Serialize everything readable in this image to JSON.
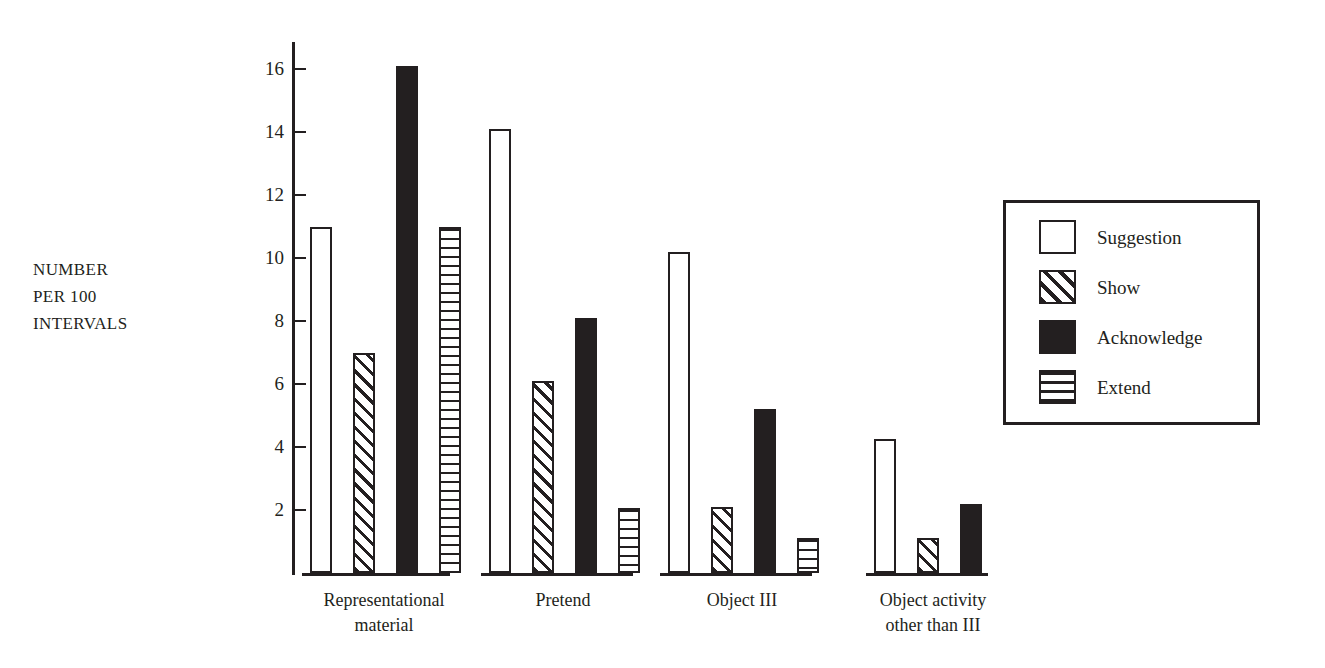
{
  "chart_data": {
    "type": "bar",
    "title": "",
    "xlabel": "",
    "ylabel": "NUMBER PER 100 INTERVALS",
    "ylabel_lines": [
      "NUMBER",
      "PER 100",
      "INTERVALS"
    ],
    "categories": [
      "Representational material",
      "Pretend",
      "Object III",
      "Object activity other than III"
    ],
    "category_lines": [
      [
        "Representational",
        "material"
      ],
      [
        "Pretend"
      ],
      [
        "Object III"
      ],
      [
        "Object activity",
        "other than III"
      ]
    ],
    "series": [
      {
        "name": "Suggestion",
        "pattern": "empty",
        "values": [
          11.0,
          14.1,
          10.2,
          4.25
        ]
      },
      {
        "name": "Show",
        "pattern": "diagonal",
        "values": [
          7.0,
          6.1,
          2.1,
          1.1
        ]
      },
      {
        "name": "Acknowledge",
        "pattern": "solid-black",
        "values": [
          16.1,
          8.1,
          5.2,
          2.2
        ]
      },
      {
        "name": "Extend",
        "pattern": "horizontal",
        "values": [
          11.0,
          2.05,
          1.1,
          0
        ]
      }
    ],
    "ylim": [
      0,
      17.2
    ],
    "yticks": [
      2,
      4,
      6,
      8,
      10,
      12,
      14,
      16
    ],
    "ytick_labels": [
      "2",
      "4",
      "6",
      "8",
      "10",
      "12",
      "14",
      "16"
    ],
    "grid": false,
    "legend_position": "right",
    "legend_entries": [
      "Suggestion",
      "Show",
      "Acknowledge",
      "Extend"
    ],
    "colors": {
      "ink": "#231f20",
      "background": "#ffffff"
    }
  }
}
